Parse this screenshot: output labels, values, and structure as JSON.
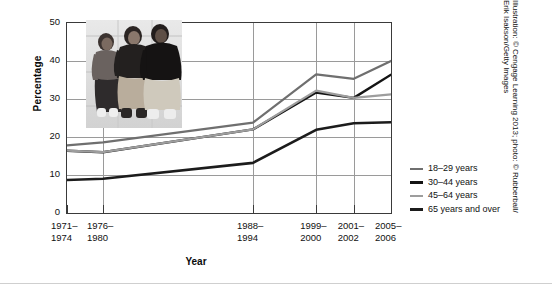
{
  "chart_data": {
    "type": "line",
    "title": "",
    "xlabel": "Year",
    "ylabel": "Percentage",
    "categories": [
      "1971–\n1974",
      "1976–\n1980",
      "1988–\n1994",
      "1999–\n2000",
      "2001–\n2002",
      "2005–\n2006"
    ],
    "category_positions": [
      0.0,
      0.111,
      0.574,
      0.769,
      0.885,
      1.0
    ],
    "ylim": [
      0,
      50
    ],
    "yticks": [
      0,
      10,
      20,
      30,
      40,
      50
    ],
    "grid": true,
    "legend_position": "right",
    "series": [
      {
        "name": "18–29 years",
        "color": "#6f6f6f",
        "width": 2.2,
        "values": [
          17.8,
          18.6,
          23.8,
          36.5,
          35.3,
          40.0
        ]
      },
      {
        "name": "30–44 years",
        "color": "#141414",
        "width": 2.4,
        "values": [
          16.4,
          16.0,
          22.0,
          31.7,
          30.3,
          36.4
        ]
      },
      {
        "name": "45–64 years",
        "color": "#9d9d9d",
        "width": 2.2,
        "values": [
          16.4,
          16.0,
          22.0,
          32.2,
          30.3,
          31.2
        ]
      },
      {
        "name": "65 years and over",
        "color": "#1c1c1c",
        "width": 2.6,
        "values": [
          8.7,
          9.0,
          13.2,
          21.9,
          23.6,
          23.9
        ]
      }
    ]
  },
  "credit": {
    "text": "Illustration: © Cengage Learning 2013; photo: © Rubberball/\nErik Isakson/Getty Images"
  },
  "photo": {
    "alt": "three-people-photo"
  }
}
